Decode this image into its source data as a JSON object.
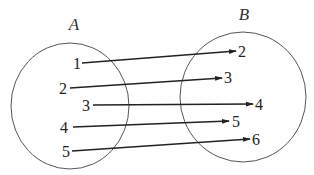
{
  "diagram": {
    "type": "mapping",
    "colors": {
      "circle": "#555555",
      "arrow": "#222222",
      "text": "#222222",
      "background": "#ffffff"
    },
    "sets": [
      {
        "name": "A",
        "label": "A",
        "label_pos": [
          74,
          30
        ],
        "ellipse": {
          "cx": 70,
          "cy": 106,
          "rx": 59,
          "ry": 63
        },
        "elements": [
          {
            "value": "1",
            "x": 77,
            "y": 69
          },
          {
            "value": "2",
            "x": 63,
            "y": 94
          },
          {
            "value": "3",
            "x": 86,
            "y": 111
          },
          {
            "value": "4",
            "x": 64,
            "y": 133
          },
          {
            "value": "5",
            "x": 66,
            "y": 157
          }
        ]
      },
      {
        "name": "B",
        "label": "B",
        "label_pos": [
          244,
          20
        ],
        "ellipse": {
          "cx": 243,
          "cy": 97,
          "rx": 63,
          "ry": 65
        },
        "elements": [
          {
            "value": "2",
            "x": 242,
            "y": 57
          },
          {
            "value": "3",
            "x": 228,
            "y": 83
          },
          {
            "value": "4",
            "x": 259,
            "y": 110
          },
          {
            "value": "5",
            "x": 236,
            "y": 127
          },
          {
            "value": "6",
            "x": 256,
            "y": 145
          }
        ]
      }
    ],
    "mappings": [
      {
        "from": "1",
        "to": "2",
        "x1": 82,
        "y1": 63,
        "x2": 236,
        "y2": 51
      },
      {
        "from": "2",
        "x1": 70,
        "y1": 88,
        "to": "3",
        "x2": 222,
        "y2": 78
      },
      {
        "from": "3",
        "x1": 93,
        "y1": 105,
        "to": "4",
        "x2": 253,
        "y2": 104
      },
      {
        "from": "4",
        "x1": 73,
        "y1": 127,
        "to": "5",
        "x2": 229,
        "y2": 121
      },
      {
        "from": "5",
        "x1": 72,
        "y1": 151,
        "to": "6",
        "x2": 250,
        "y2": 139
      }
    ]
  }
}
